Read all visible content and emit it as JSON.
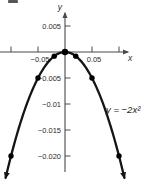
{
  "figure": {
    "background": "#ffffff",
    "curve_color": "#141414",
    "axis_color": "#4a4a4a",
    "text_color": "#2b2b2b",
    "point_color": "#000000"
  },
  "chart_data": {
    "type": "line",
    "title": "",
    "function": "f(x) = -2x^2",
    "equation_label": "y = −2x²",
    "xlabel": "x",
    "ylabel": "y",
    "xlim": [
      -0.118,
      0.125
    ],
    "ylim": [
      -0.0245,
      0.0075
    ],
    "grid": false,
    "legend": "none",
    "curve": {
      "coefficient": -2,
      "power": 2,
      "x_min": -0.11,
      "x_max": 0.11,
      "step": 0.0025
    },
    "x_ticks": [
      -0.1,
      -0.05,
      0.05,
      0.1
    ],
    "x_tick_labels": [
      "",
      "−0.05",
      "0.05",
      ""
    ],
    "y_ticks": [
      0.005,
      -0.005,
      -0.01,
      -0.015,
      -0.02
    ],
    "y_tick_labels": [
      "0.005",
      "−0.005",
      "−0.01",
      "−0.015",
      "−0.020"
    ],
    "points": [
      {
        "x": -0.1,
        "y": -0.02
      },
      {
        "x": -0.05,
        "y": -0.005
      },
      {
        "x": -0.02,
        "y": -0.0008
      },
      {
        "x": 0,
        "y": 0
      },
      {
        "x": 0.02,
        "y": -0.0008
      },
      {
        "x": 0.05,
        "y": -0.005
      },
      {
        "x": 0.1,
        "y": -0.02
      }
    ]
  }
}
